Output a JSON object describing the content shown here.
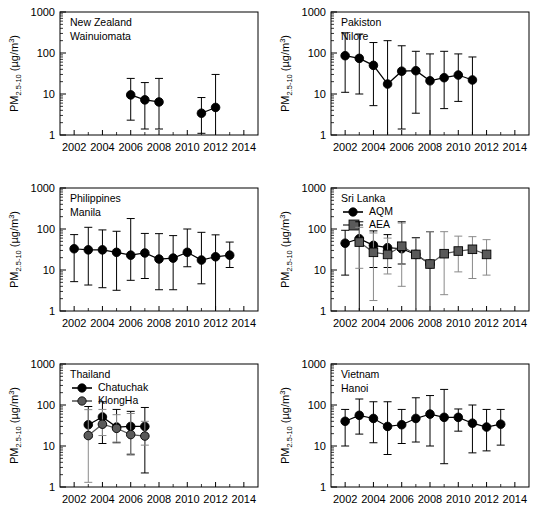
{
  "figure": {
    "axis_title_prefix": "PM",
    "axis_title_subscript": "2.5-10",
    "axis_title_units": " (µg/m",
    "axis_title_units_sup": "3",
    "axis_title_units_close": ")",
    "y_ticks": [
      "1",
      "10",
      "100",
      "1000"
    ],
    "x_ticks": [
      "2002",
      "2004",
      "2006",
      "2008",
      "2010",
      "2012",
      "2014"
    ],
    "colors": {
      "axis": "#000000",
      "series_primary": "#000000",
      "series_secondary": "#5a5a5a",
      "background": "#ffffff"
    }
  },
  "chart_data": [
    {
      "type": "scatter",
      "panel_index": 0,
      "title": "New Zealand",
      "subtitle": "Wainuiomata",
      "xlabel": "",
      "ylabel": "PM2.5-10 (µg/m3)",
      "yscale": "log",
      "ylim": [
        1,
        1000
      ],
      "xlim": [
        2001,
        2015
      ],
      "yticks": [
        1,
        10,
        100,
        1000
      ],
      "xticks": [
        2002,
        2004,
        2006,
        2008,
        2010,
        2012,
        2014
      ],
      "grid": false,
      "legend": null,
      "series": [
        {
          "name": "Wainuiomata",
          "marker": "circle",
          "color": "#000000",
          "segments": [
            [
              2006,
              2007,
              2008
            ],
            [
              2011,
              2012
            ]
          ],
          "x": [
            2006,
            2007,
            2008,
            2011,
            2012
          ],
          "values": [
            9.5,
            7.2,
            6.4,
            3.4,
            4.7
          ],
          "err_low": [
            2.3,
            1.4,
            1.4,
            1.1,
            1.0
          ],
          "err_high": [
            24.0,
            19.0,
            24.0,
            8.2,
            30.0
          ]
        }
      ]
    },
    {
      "type": "scatter",
      "panel_index": 1,
      "title": "Pakiston",
      "subtitle": "Nilore",
      "xlabel": "",
      "ylabel": "PM2.5-10 (µg/m3)",
      "yscale": "log",
      "ylim": [
        1,
        1000
      ],
      "xlim": [
        2001,
        2015
      ],
      "yticks": [
        1,
        10,
        100,
        1000
      ],
      "xticks": [
        2002,
        2004,
        2006,
        2008,
        2010,
        2012,
        2014
      ],
      "grid": false,
      "legend": null,
      "series": [
        {
          "name": "Nilore",
          "marker": "circle",
          "color": "#000000",
          "segments": [
            [
              2002,
              2003,
              2004,
              2005,
              2006,
              2007,
              2008,
              2009,
              2010,
              2011
            ]
          ],
          "x": [
            2002,
            2003,
            2004,
            2005,
            2006,
            2007,
            2008,
            2009,
            2010,
            2011
          ],
          "values": [
            86,
            74,
            50,
            17.5,
            36,
            37,
            21,
            25,
            29,
            22
          ],
          "err_low": [
            11,
            10,
            5.2,
            1.0,
            1.4,
            3.4,
            1.0,
            4.4,
            6.6,
            1.0
          ],
          "err_high": [
            310,
            290,
            180,
            200,
            150,
            110,
            95,
            110,
            95,
            80
          ]
        }
      ]
    },
    {
      "type": "scatter",
      "panel_index": 2,
      "title": "Philippines",
      "subtitle": "Manila",
      "xlabel": "",
      "ylabel": "PM2.5-10 (µg/m3)",
      "yscale": "log",
      "ylim": [
        1,
        1000
      ],
      "xlim": [
        2001,
        2015
      ],
      "yticks": [
        1,
        10,
        100,
        1000
      ],
      "xticks": [
        2002,
        2004,
        2006,
        2008,
        2010,
        2012,
        2014
      ],
      "grid": false,
      "legend": null,
      "series": [
        {
          "name": "Manila",
          "marker": "circle",
          "color": "#000000",
          "segments": [
            [
              2002,
              2003,
              2004,
              2005,
              2006,
              2007,
              2008,
              2009,
              2010,
              2011,
              2012,
              2013
            ]
          ],
          "x": [
            2002,
            2003,
            2004,
            2005,
            2006,
            2007,
            2008,
            2009,
            2010,
            2011,
            2012,
            2013
          ],
          "values": [
            33,
            31,
            31,
            27,
            23,
            26,
            18.5,
            19.5,
            27,
            17.5,
            21,
            23
          ],
          "err_low": [
            5.2,
            4.3,
            3.7,
            3.2,
            5.6,
            6.2,
            3.3,
            3.3,
            12.0,
            4.6,
            1.0,
            11.5
          ],
          "err_high": [
            73,
            110,
            95,
            88,
            180,
            78,
            77,
            69,
            100,
            83,
            72,
            48
          ]
        }
      ]
    },
    {
      "type": "scatter",
      "panel_index": 3,
      "title": "Sri Lanka",
      "subtitle": "",
      "xlabel": "",
      "ylabel": "PM2.5-10 (µg/m3)",
      "yscale": "log",
      "ylim": [
        1,
        1000
      ],
      "xlim": [
        2001,
        2015
      ],
      "yticks": [
        1,
        10,
        100,
        1000
      ],
      "xticks": [
        2002,
        2004,
        2006,
        2008,
        2010,
        2012,
        2014
      ],
      "grid": false,
      "legend": {
        "position": "top-left",
        "entries": [
          "AQM",
          "AEA"
        ]
      },
      "series": [
        {
          "name": "AQM",
          "marker": "circle",
          "color": "#000000",
          "segments": [
            [
              2002,
              2003,
              2004,
              2005,
              2006,
              2007,
              2008
            ]
          ],
          "x": [
            2002,
            2003,
            2004,
            2005,
            2006,
            2007,
            2008
          ],
          "values": [
            45,
            58,
            40,
            35,
            33,
            24,
            14
          ],
          "err_low": [
            7.5,
            1.0,
            11.5,
            11.5,
            14.0,
            1.0,
            1.0
          ],
          "err_high": [
            93,
            150,
            90,
            73,
            150,
            62,
            86
          ]
        },
        {
          "name": "AEA",
          "marker": "square",
          "color": "#5a5a5a",
          "segments": [
            [
              2003,
              2004,
              2005,
              2006,
              2007,
              2008,
              2009,
              2010,
              2011,
              2012
            ]
          ],
          "x": [
            2003,
            2004,
            2005,
            2006,
            2007,
            2008,
            2009,
            2010,
            2011,
            2012
          ],
          "values": [
            48,
            27,
            24,
            38,
            24,
            14,
            25,
            29,
            32,
            24
          ],
          "err_low": [
            11.0,
            1.8,
            8.0,
            4.0,
            1.0,
            1.0,
            2.5,
            9.0,
            6.2,
            7.5
          ],
          "err_high": [
            110,
            80,
            60,
            140,
            60,
            86,
            86,
            67,
            65,
            55
          ]
        }
      ]
    },
    {
      "type": "scatter",
      "panel_index": 4,
      "title": "Thailand",
      "subtitle": "",
      "xlabel": "",
      "ylabel": "PM2.5-10 (µg/m3)",
      "yscale": "log",
      "ylim": [
        1,
        1000
      ],
      "xlim": [
        2001,
        2015
      ],
      "yticks": [
        1,
        10,
        100,
        1000
      ],
      "xticks": [
        2002,
        2004,
        2006,
        2008,
        2010,
        2012,
        2014
      ],
      "grid": false,
      "legend": {
        "position": "top-left",
        "entries": [
          "Chatuchak",
          "KlongHa"
        ]
      },
      "series": [
        {
          "name": "Chatuchak",
          "marker": "circle",
          "color": "#000000",
          "segments": [
            [
              2003,
              2004,
              2005,
              2006,
              2007
            ]
          ],
          "x": [
            2003,
            2004,
            2005,
            2006,
            2007
          ],
          "values": [
            33,
            51,
            29,
            30,
            30
          ],
          "err_low": [
            16.0,
            11.5,
            12.0,
            6.3,
            2.2
          ],
          "err_high": [
            92,
            120,
            78,
            70,
            87
          ]
        },
        {
          "name": "KlongHa",
          "marker": "circle",
          "color": "#5a5a5a",
          "segments": [
            [
              2003,
              2004,
              2005,
              2006,
              2007
            ]
          ],
          "x": [
            2003,
            2004,
            2005,
            2006,
            2007
          ],
          "values": [
            18,
            34,
            27,
            19,
            17.5
          ],
          "err_low": [
            1.3,
            18.0,
            12.5,
            6.0,
            10.5
          ],
          "err_high": [
            77,
            78,
            58,
            62,
            40
          ]
        }
      ]
    },
    {
      "type": "scatter",
      "panel_index": 5,
      "title": "Vietnam",
      "subtitle": "Hanoi",
      "xlabel": "",
      "ylabel": "PM2.5-10 (µg/m3)",
      "yscale": "log",
      "ylim": [
        1,
        1000
      ],
      "xlim": [
        2001,
        2015
      ],
      "yticks": [
        1,
        10,
        100,
        1000
      ],
      "xticks": [
        2002,
        2004,
        2006,
        2008,
        2010,
        2012,
        2014
      ],
      "grid": false,
      "legend": null,
      "series": [
        {
          "name": "Hanoi",
          "marker": "circle",
          "color": "#000000",
          "segments": [
            [
              2002,
              2003,
              2004,
              2005,
              2006,
              2007,
              2008,
              2009,
              2010,
              2011,
              2012,
              2013
            ]
          ],
          "x": [
            2002,
            2003,
            2004,
            2005,
            2006,
            2007,
            2008,
            2009,
            2010,
            2011,
            2012,
            2013
          ],
          "values": [
            40,
            56,
            47,
            30,
            33,
            47,
            60,
            50,
            50,
            36,
            29,
            34
          ],
          "err_low": [
            10.0,
            19.5,
            12.0,
            6.2,
            11.5,
            12.5,
            10.0,
            3.7,
            23.0,
            6.8,
            7.6,
            10.5
          ],
          "err_high": [
            78,
            140,
            120,
            120,
            78,
            150,
            170,
            240,
            80,
            100,
            78,
            78
          ]
        }
      ]
    }
  ]
}
